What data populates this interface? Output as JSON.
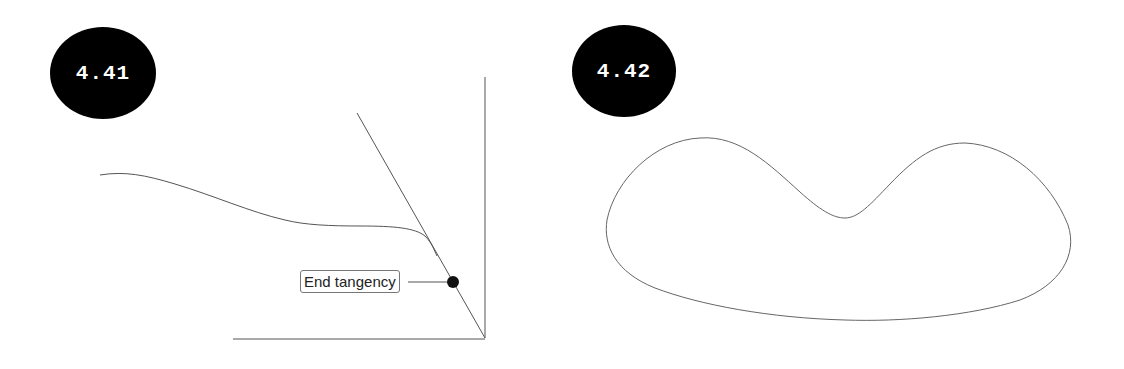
{
  "figures": [
    {
      "id_label": "4.41",
      "callout": "End tangency",
      "elements": [
        "open spline curve",
        "tangent line",
        "vertical axis line",
        "horizontal axis line",
        "end-tangency point marker"
      ]
    },
    {
      "id_label": "4.42",
      "elements": [
        "closed spline curve (bean shape)"
      ]
    }
  ],
  "colors": {
    "badge_bg": "#000000",
    "badge_text": "#ffffff",
    "line": "#555555",
    "marker": "#111111"
  }
}
